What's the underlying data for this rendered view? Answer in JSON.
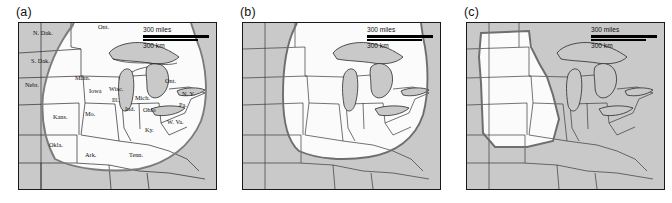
{
  "figure": {
    "type": "map-figure",
    "panel_count": 3,
    "frame": {
      "fill_outside": "#c9c9c9",
      "fill_inside": "#fbfbfb",
      "border": "#1a1a1a"
    }
  },
  "panels": [
    {
      "id": "panel-a",
      "label": "(a)",
      "has_state_labels": true,
      "region_outline_color": "#777777",
      "scalebar": {
        "miles": "300 miles",
        "km": "300 km"
      },
      "state_labels": [
        {
          "text": "N. Dak.",
          "x": 14,
          "y": 12
        },
        {
          "text": "Ont.",
          "x": 79,
          "y": 6
        },
        {
          "text": "S. Dak.",
          "x": 12,
          "y": 40
        },
        {
          "text": "Nebr.",
          "x": 6,
          "y": 64
        },
        {
          "text": "Minn.",
          "x": 56,
          "y": 57
        },
        {
          "text": "Iowa",
          "x": 70,
          "y": 70
        },
        {
          "text": "Wisc.",
          "x": 90,
          "y": 68
        },
        {
          "text": "Ill.",
          "x": 93,
          "y": 79
        },
        {
          "text": "Mich.",
          "x": 116,
          "y": 77
        },
        {
          "text": "Ind.",
          "x": 108,
          "y": 88
        },
        {
          "text": "Ohio",
          "x": 126,
          "y": 88
        },
        {
          "text": "Ont.",
          "x": 146,
          "y": 60
        },
        {
          "text": "N. Y.",
          "x": 160,
          "y": 72
        },
        {
          "text": "Pa.",
          "x": 157,
          "y": 82
        },
        {
          "text": "Kans.",
          "x": 34,
          "y": 96
        },
        {
          "text": "Mo.",
          "x": 66,
          "y": 93
        },
        {
          "text": "Ky.",
          "x": 126,
          "y": 107
        },
        {
          "text": "W. Va.",
          "x": 149,
          "y": 100
        },
        {
          "text": "Okla.",
          "x": 30,
          "y": 124
        },
        {
          "text": "Ark.",
          "x": 66,
          "y": 131
        },
        {
          "text": "Tenn.",
          "x": 110,
          "y": 130
        }
      ]
    },
    {
      "id": "panel-b",
      "label": "(b)",
      "has_state_labels": false,
      "region_outline_color": "#6e6e6e",
      "scalebar": {
        "miles": "300 miles",
        "km": "300 km"
      },
      "state_labels": []
    },
    {
      "id": "panel-c",
      "label": "(c)",
      "has_state_labels": false,
      "region_outline_color": "#6e6e6e",
      "scalebar": {
        "miles": "300 miles",
        "km": "300 km"
      },
      "state_labels": []
    }
  ]
}
